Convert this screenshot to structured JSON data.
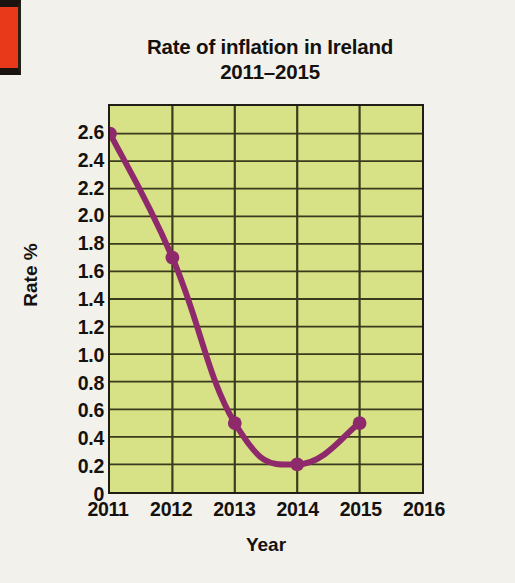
{
  "chart_data": {
    "type": "line",
    "title": "Rate of inflation in Ireland",
    "subtitle": "2011–2015",
    "xlabel": "Year",
    "ylabel": "Rate %",
    "x": [
      2011,
      2012,
      2013,
      2014,
      2015
    ],
    "values": [
      2.6,
      1.7,
      0.5,
      0.2,
      0.5
    ],
    "series": [
      {
        "name": "Rate of inflation",
        "values": [
          2.6,
          1.7,
          0.5,
          0.2,
          0.5
        ]
      }
    ],
    "x_tick_labels": [
      "2011",
      "2012",
      "2013",
      "2014",
      "2015",
      "2016"
    ],
    "x_tick_values": [
      2011,
      2012,
      2013,
      2014,
      2015,
      2016
    ],
    "y_tick_labels": [
      "2.6",
      "2.4",
      "2.2",
      "2.0",
      "1.8",
      "1.6",
      "1.4",
      "1.2",
      "1.0",
      "0.8",
      "0.6",
      "0.4",
      "0.2",
      "0"
    ],
    "y_tick_values": [
      2.6,
      2.4,
      2.2,
      2.0,
      1.8,
      1.6,
      1.4,
      1.2,
      1.0,
      0.8,
      0.6,
      0.4,
      0.2,
      0
    ],
    "xlim": [
      2011,
      2016
    ],
    "ylim": [
      0,
      2.8
    ],
    "grid": true,
    "legend": "none",
    "marker": "filled-circle",
    "colors": {
      "line": "#8e2a6b",
      "marker": "#8e2a6b",
      "plot_background": "#d7e185",
      "grid": "#3a3b1e",
      "axis": "#211d14",
      "page_background": "#f2f1ec",
      "text": "#15120e",
      "scan_artifact": "#e8391a"
    }
  }
}
